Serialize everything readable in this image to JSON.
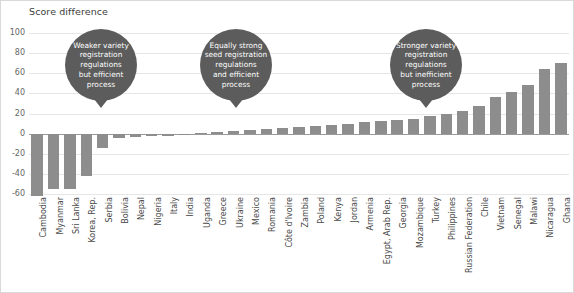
{
  "chart_data": {
    "type": "bar",
    "title": "Score difference",
    "xlabel": "",
    "ylabel": "",
    "ylim": [
      -60,
      100
    ],
    "yticks": [
      100,
      80,
      60,
      40,
      20,
      0,
      -20,
      -40,
      -60
    ],
    "grid": true,
    "legend": "none",
    "categories": [
      "Cambodia",
      "Myanmar",
      "Sri Lanka",
      "Korea, Rep.",
      "Serbia",
      "Bolivia",
      "Nepal",
      "Nigeria",
      "Italy",
      "India",
      "Uganda",
      "Greece",
      "Ukraine",
      "Mexico",
      "Romania",
      "Côte d'Ivoire",
      "Zambia",
      "Poland",
      "Kenya",
      "Jordan",
      "Armenia",
      "Egypt, Arab Rep.",
      "Georgia",
      "Mozambique",
      "Turkey",
      "Philippines",
      "Russian Federation",
      "Chile",
      "Vietnam",
      "Senegal",
      "Malawi",
      "Nicaragua",
      "Ghana"
    ],
    "values": [
      -62,
      -55,
      -55,
      -42,
      -14,
      -4,
      -3,
      -2,
      -2,
      -1,
      1,
      2,
      3,
      4,
      5,
      6,
      7,
      8,
      9,
      10,
      12,
      13,
      14,
      15,
      18,
      20,
      22,
      27,
      36,
      41,
      48,
      64,
      70
    ],
    "annotations": [
      {
        "id": "annotation-weaker",
        "lines": [
          "Weaker variety",
          "registration",
          "regulations",
          "but efficient",
          "process"
        ],
        "points_to": "Korea, Rep."
      },
      {
        "id": "annotation-equal",
        "lines": [
          "Equally strong",
          "seed registration",
          "regulations",
          "and efficient",
          "process"
        ],
        "points_to": "Nigeria"
      },
      {
        "id": "annotation-stronger",
        "lines": [
          "Stronger variety",
          "registration",
          "regulations",
          "but inefficient",
          "process"
        ],
        "points_to": "Armenia"
      }
    ],
    "colors": {
      "bar": "#8d8d8d",
      "bubble": "#5c5c5c",
      "gridline": "#e6e6e6",
      "zero_axis": "#9a9a9a",
      "text": "#4a4a4a",
      "border": "#d9d9d9",
      "background": "#ffffff"
    }
  }
}
